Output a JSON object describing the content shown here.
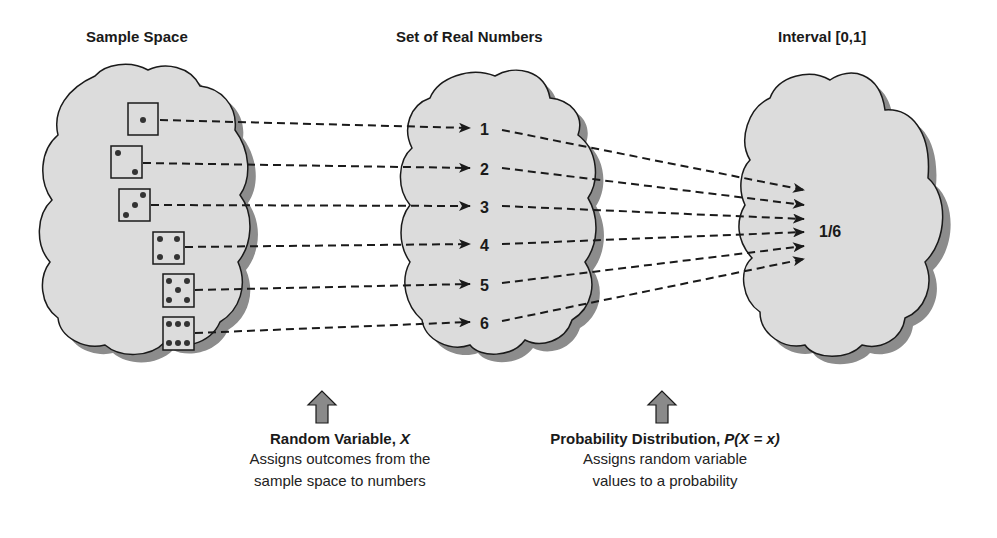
{
  "titles": {
    "sample_space": "Sample Space",
    "real_numbers": "Set of Real Numbers",
    "interval": "Interval [0,1]"
  },
  "outcomes": [
    {
      "die_face": 1,
      "value": "1"
    },
    {
      "die_face": 2,
      "value": "2"
    },
    {
      "die_face": 3,
      "value": "3"
    },
    {
      "die_face": 4,
      "value": "4"
    },
    {
      "die_face": 5,
      "value": "5"
    },
    {
      "die_face": 6,
      "value": "6"
    }
  ],
  "probability_value": "1/6",
  "captions": {
    "random_variable": {
      "head_text": "Random Variable, ",
      "head_symbol": "X",
      "line1": "Assigns outcomes from the",
      "line2": "sample space to numbers"
    },
    "probability_distribution": {
      "head_text": "Probability Distribution, ",
      "head_symbol": "P(X = x)",
      "line1": "Assigns random variable",
      "line2": "values to a probability"
    }
  },
  "colors": {
    "cloud_fill": "#dcdcdc",
    "cloud_shadow": "#8c8c8c",
    "outline": "#1a1a1a",
    "arrow_fill": "#8a8a8a"
  }
}
